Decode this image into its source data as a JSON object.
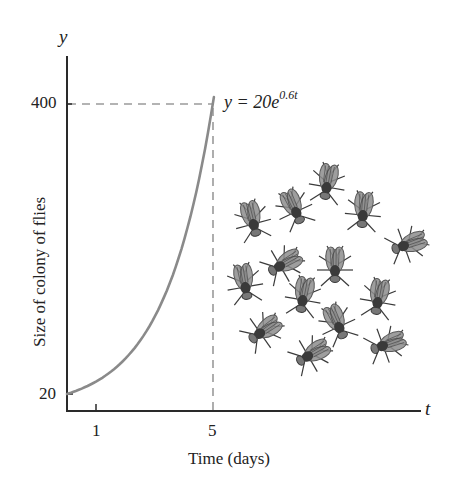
{
  "chart_data": {
    "type": "line",
    "title": "",
    "xlabel": "Time (days)",
    "ylabel": "Size of colony of flies",
    "x_axis_var": "t",
    "y_axis_var": "y",
    "x_ticks": [
      {
        "value": 1,
        "label": "1"
      },
      {
        "value": 5,
        "label": "5"
      }
    ],
    "y_ticks": [
      {
        "value": 20,
        "label": "20"
      },
      {
        "value": 400,
        "label": "400"
      }
    ],
    "series": [
      {
        "name": "y = 20e^{0.6t}",
        "equation": "y = 20e^(0.6t)",
        "color": "#8a8a8a",
        "x": [
          0,
          1,
          2,
          3,
          4,
          5
        ],
        "values": [
          20,
          36.4,
          66.4,
          121.0,
          220.5,
          401.7
        ]
      }
    ],
    "annotations": [
      {
        "type": "dashed-hline",
        "y": 400,
        "from_x": 0,
        "to_x": 5
      },
      {
        "type": "dashed-vline",
        "x": 5,
        "from_y": 0,
        "to_y": 400
      },
      {
        "type": "label",
        "text": "y = 20e^{0.6t}",
        "near": [
          5,
          400
        ]
      },
      {
        "type": "illustration",
        "text": "cluster of 14 flies"
      }
    ],
    "grid": false,
    "legend": "none",
    "xlim": [
      0,
      9.5
    ],
    "ylim": [
      0,
      440
    ]
  },
  "labels": {
    "y_var": "y",
    "t_var": "t",
    "ylabel": "Size of colony of flies",
    "xlabel": "Time (days)",
    "ytick_400": "400",
    "ytick_20": "20",
    "xtick_1": "1",
    "xtick_5": "5",
    "eq_prefix": "y = 20e",
    "eq_exp": "0.6t"
  },
  "colors": {
    "axis": "#2a2a2a",
    "curve": "#8a8a8a",
    "dash": "#9a9a9a",
    "fly_body": "#3a3a3a",
    "fly_wing": "#5a5a5a"
  },
  "illustration": {
    "name": "fly-colony",
    "count": 14
  }
}
